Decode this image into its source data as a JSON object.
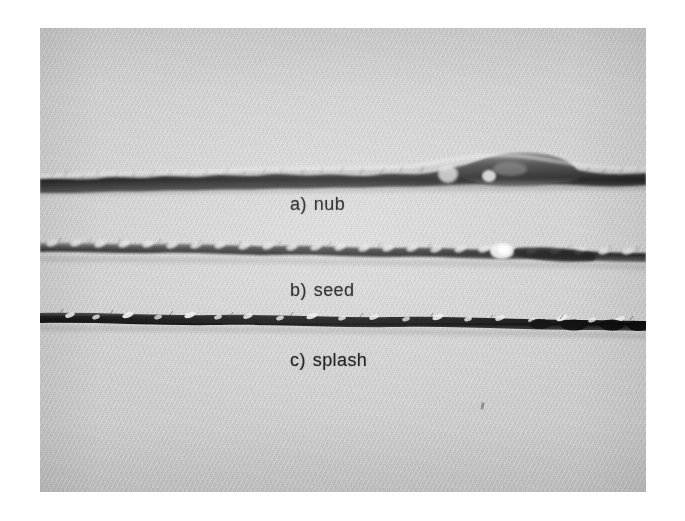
{
  "figure": {
    "kind": "photograph",
    "caption_labels": [
      {
        "key": "a)",
        "name": "nub"
      },
      {
        "key": "b)",
        "name": "seed"
      },
      {
        "key": "c)",
        "name": "splash"
      }
    ],
    "background_color": "#ffffff",
    "photo_tone_color": "#d2d2d2",
    "yarn_dark_color": "#2b2b2b",
    "label_color": "#171717",
    "samples": [
      {
        "id": "nub",
        "label_key": "a)",
        "label_name": "nub",
        "description": "yarn with a thick bulge defect toward the right side"
      },
      {
        "id": "seed",
        "label_key": "b)",
        "label_name": "seed",
        "description": "twisted yarn with a small bright knot defect"
      },
      {
        "id": "splash",
        "label_key": "c)",
        "label_name": "splash",
        "description": "dark yarn with scattered bright fibre flecks"
      }
    ]
  }
}
